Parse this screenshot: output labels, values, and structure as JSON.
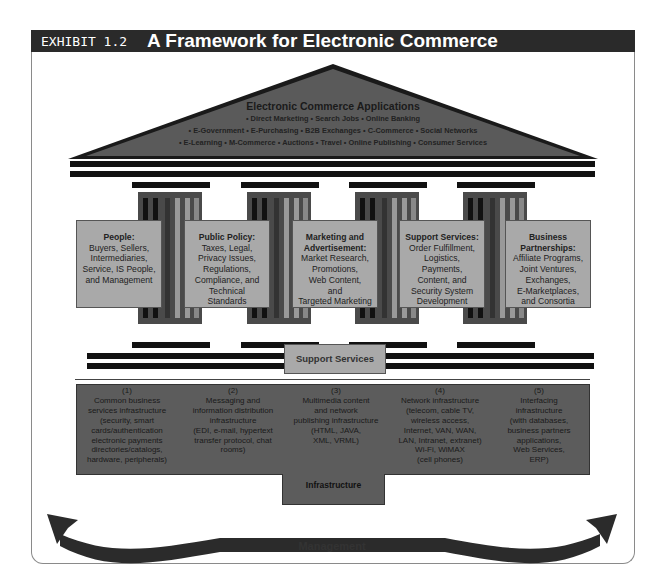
{
  "header": {
    "exhibit_label": "EXHIBIT 1.2",
    "title": "A Framework for Electronic Commerce"
  },
  "roof": {
    "title": "Electronic Commerce Applications",
    "lines": [
      "• Direct Marketing • Search Jobs • Online Banking",
      "• E-Government • E-Purchasing • B2B Exchanges • C-Commerce • Social Networks",
      "• E-Learning • M-Commerce • Auctions • Travel • Online Publishing • Consumer Services"
    ]
  },
  "pillars": [
    {
      "title": "People:",
      "body": [
        "Buyers, Sellers,",
        "Intermediaries,",
        "Service, IS People,",
        "and Management"
      ]
    },
    {
      "title": "Public Policy:",
      "body": [
        "Taxes, Legal,",
        "Privacy Issues,",
        "Regulations,",
        "Compliance, and",
        "Technical",
        "Standards"
      ]
    },
    {
      "title": "Marketing and Advertisement:",
      "title_lines": [
        "Marketing and",
        "Advertisement:"
      ],
      "body": [
        "Market Research,",
        "Promotions,",
        "Web Content,",
        "and",
        "Targeted Marketing"
      ]
    },
    {
      "title": "Support Services:",
      "body": [
        "Order Fulfillment,",
        "Logistics,",
        "Payments,",
        "Content, and",
        "Security System",
        "Development"
      ]
    },
    {
      "title": "Business Partnerships:",
      "title_lines": [
        "Business",
        "Partnerships:"
      ],
      "body": [
        "Affiliate Programs,",
        "Joint Ventures,",
        "Exchanges,",
        "E-Marketplaces,",
        "and Consortia"
      ]
    }
  ],
  "support_services_label": "Support Services",
  "infrastructure": {
    "label": "Infrastructure",
    "items": [
      {
        "num": "(1)",
        "lines": [
          "Common business",
          "services infrastructure",
          "(security, smart",
          "cards/authentication",
          "electronic payments",
          "directories/catalogs,",
          "hardware, peripherals)"
        ]
      },
      {
        "num": "(2)",
        "lines": [
          "Messaging and",
          "information distribution",
          "infrastructure",
          "(EDI, e-mail, hypertext",
          "transfer protocol, chat",
          "rooms)"
        ]
      },
      {
        "num": "(3)",
        "lines": [
          "Multimedia content",
          "and network",
          "publishing infrastructure",
          "(HTML, JAVA,",
          "XML, VRML)"
        ]
      },
      {
        "num": "(4)",
        "lines": [
          "Network infrastructure",
          "(telecom, cable TV,",
          "wireless access,",
          "Internet, VAN, WAN,",
          "LAN, Intranet, extranet)",
          "Wi-Fi, WiMAX",
          "(cell phones)"
        ]
      },
      {
        "num": "(5)",
        "lines": [
          "Interfacing",
          "infrastructure",
          "(with databases,",
          "business partners",
          "applications,",
          "Web Services,",
          "ERP)"
        ]
      }
    ]
  },
  "management_label": "Management",
  "colors": {
    "header_bg": "#2a2a2a",
    "roof_fill": "#5a5a5a",
    "pillar_fill": "#a9a9a9",
    "infra_fill": "#5c5c5c",
    "beam": "#111111"
  }
}
